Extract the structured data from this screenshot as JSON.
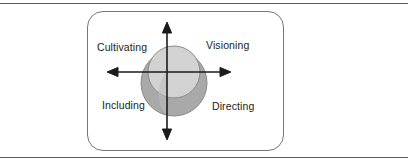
{
  "figure": {
    "card_name": "leadership-quadrant-card",
    "labels": {
      "top_left": "Cultivating",
      "top_right": "Visioning",
      "bottom_left": "Including",
      "bottom_right": "Directing"
    },
    "colors": {
      "upper_circle": "#d2d2d2",
      "lower_circle": "#a9a9a9",
      "overlap_left": "#bcbcbc",
      "shape_stroke": "#8a8a8a",
      "axis": "#1b1b1b",
      "card_border": "#777777",
      "rule": "#5a5a5a",
      "text": "#1b1b1b"
    },
    "axes": {
      "horizontal_arrow": "double-headed-horizontal-axis",
      "vertical_arrow": "double-headed-vertical-axis"
    }
  }
}
